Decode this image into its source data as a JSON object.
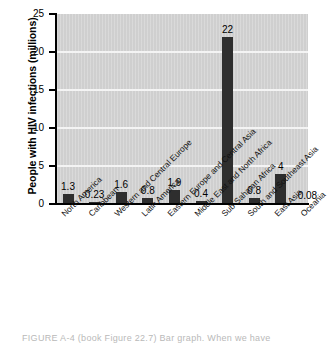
{
  "chart_data": {
    "type": "bar",
    "title": "",
    "xlabel": "",
    "ylabel": "People with HIV infections (millions)",
    "ylim": [
      0,
      25
    ],
    "ytick_values": [
      25,
      20,
      15,
      10,
      5,
      0
    ],
    "ytick_labels": [
      "25",
      "20",
      "15",
      "10",
      "5",
      "0"
    ],
    "grid": true,
    "legend": "none",
    "categories": [
      "North America",
      "Caribbean",
      "Western and Central Europe",
      "Latin America",
      "Eastern Europe and Central Asia",
      "Middle East and North Africa",
      "Sub-Saharan Africa",
      "South and Southeast Asia",
      "East Asia",
      "Oceania"
    ],
    "values": [
      1.3,
      0.23,
      1.6,
      0.8,
      1.9,
      0.4,
      22,
      0.8,
      4,
      0.08
    ],
    "value_labels": [
      "1.3",
      "0.23",
      "1.6",
      "0.8",
      "1.9",
      "0.4",
      "22",
      "0.8",
      "4",
      "0.08"
    ],
    "bar_color": "#2e2e2e",
    "plot_background": "#cfcfcf",
    "gridline_color": "#f4f4f4"
  },
  "caption": {
    "text": "FIGURE A-4  (book Figure 22.7)  Bar graph.  When we have"
  }
}
